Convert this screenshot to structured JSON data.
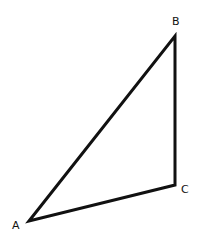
{
  "diagram": {
    "type": "triangle",
    "stroke_color": "#111111",
    "stroke_width": 3,
    "vertices": [
      {
        "label": "A",
        "x": 29,
        "y": 221,
        "label_x": 12,
        "label_y": 229
      },
      {
        "label": "B",
        "x": 175,
        "y": 36,
        "label_x": 172,
        "label_y": 25
      },
      {
        "label": "C",
        "x": 175,
        "y": 185,
        "label_x": 181,
        "label_y": 193
      }
    ],
    "sides": [
      {
        "from": "A",
        "to": "B"
      },
      {
        "from": "B",
        "to": "C"
      },
      {
        "from": "C",
        "to": "A"
      }
    ]
  }
}
